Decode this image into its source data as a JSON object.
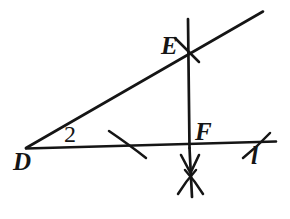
{
  "figure": {
    "background_color": "#ffffff",
    "stroke_color": "#151515",
    "labels": {
      "vertex_D": "D",
      "angle_2": "2",
      "point_E": "E",
      "point_F": "F",
      "line_l": "l"
    },
    "elements": {
      "line_l_name": "line-l",
      "ray_DE_name": "ray-d-e",
      "perpendicular_name": "perpendicular-line-ef",
      "arc_on_DF_name": "construction-arc-df",
      "arc_right_name": "construction-arc-right",
      "arc_at_E_name": "construction-arc-e",
      "arc_cross_below_F_name": "construction-arc-cross",
      "arrowhead_name": "arrowhead-down"
    },
    "geometry": {
      "line_l_start": [
        26,
        148
      ],
      "line_l_end": [
        276,
        141
      ],
      "ray_start": [
        26,
        148
      ],
      "ray_end": [
        263,
        11
      ],
      "vertical_top": [
        188,
        19
      ],
      "vertical_bottom": [
        192,
        196
      ],
      "point_E": [
        189,
        50
      ],
      "point_F": [
        189,
        147
      ]
    }
  }
}
